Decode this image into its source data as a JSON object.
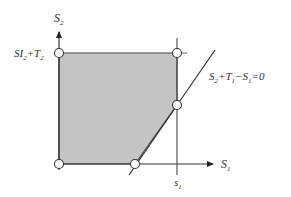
{
  "diagram": {
    "axes": {
      "y_label": "S",
      "y_label_sub": "2",
      "x_label": "S",
      "x_label_sub": "1"
    },
    "labels": {
      "y_intercept": {
        "base": "SI",
        "sub1": "2",
        "plus": "+T",
        "sub2": "2"
      },
      "equation": {
        "t1": "S",
        "s1": "2",
        "t2": "+T",
        "s2": "1",
        "t3": "−S",
        "s3": "1",
        "t4": "=0"
      },
      "x_tick": {
        "base": "s",
        "sub": "1"
      }
    },
    "region": {
      "fill": "#c4c4c4",
      "vertices": [
        [
          59,
          53
        ],
        [
          177,
          53
        ],
        [
          177,
          105
        ],
        [
          135,
          164
        ],
        [
          59,
          164
        ]
      ]
    },
    "points": [
      {
        "name": "top-left",
        "x": 59,
        "y": 53
      },
      {
        "name": "top-right",
        "x": 177,
        "y": 53
      },
      {
        "name": "right-middle",
        "x": 177,
        "y": 105
      },
      {
        "name": "bottom-right",
        "x": 135,
        "y": 164
      },
      {
        "name": "bottom-left",
        "x": 59,
        "y": 164
      }
    ]
  }
}
